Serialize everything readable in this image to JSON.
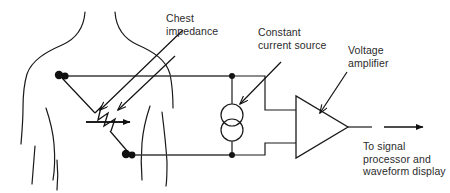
{
  "figure": {
    "background_color": "#ffffff",
    "stroke_color": "#1a1a1a",
    "text_color": "#2b2b2b",
    "width": 450,
    "height": 193
  },
  "labels": {
    "chest_impedance": "Chest\nimpedance",
    "constant_current_source": "Constant\ncurrent source",
    "voltage_amplifier": "Voltage\namplifier",
    "output_destination": "To signal\nprocessor and\nwaveform display"
  },
  "diagram": {
    "elements": [
      {
        "name": "patient-torso-outline",
        "kind": "human-body-outline"
      },
      {
        "name": "upper-electrode",
        "kind": "electrode-dot"
      },
      {
        "name": "lower-electrode",
        "kind": "electrode-dot"
      },
      {
        "name": "chest-impedance-resistor",
        "kind": "zigzag-resistor"
      },
      {
        "name": "constant-current-source",
        "kind": "double-circle-source"
      },
      {
        "name": "voltage-amplifier",
        "kind": "triangle-amplifier"
      },
      {
        "name": "output-arrow",
        "kind": "arrow"
      },
      {
        "name": "top-rail-wire",
        "kind": "wire"
      },
      {
        "name": "bottom-rail-wire",
        "kind": "wire"
      },
      {
        "name": "top-junction-node",
        "kind": "junction-dot"
      },
      {
        "name": "bottom-junction-node",
        "kind": "junction-dot"
      }
    ],
    "pointer_arrows": [
      {
        "name": "chest-impedance-pointer-left",
        "target": "chest-impedance-resistor"
      },
      {
        "name": "chest-impedance-pointer-right",
        "target": "chest-impedance-resistor"
      },
      {
        "name": "constant-current-source-pointer",
        "target": "constant-current-source"
      },
      {
        "name": "voltage-amplifier-pointer",
        "target": "voltage-amplifier"
      }
    ]
  }
}
